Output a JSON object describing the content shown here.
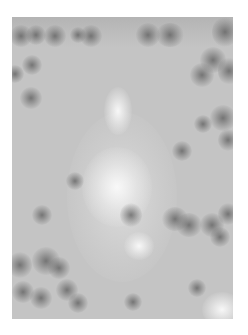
{
  "image": {
    "description": "Grayscale micrograph with a bright central elongated structure surrounded by dark spherical particles",
    "colors": {
      "background": "#ffffff",
      "field": "#c4c4c4",
      "particle": "#5a5a5a",
      "bright_region": "#f5f5f5"
    },
    "frame": {
      "x": 12,
      "y": 17,
      "width": 221,
      "height": 302
    }
  }
}
